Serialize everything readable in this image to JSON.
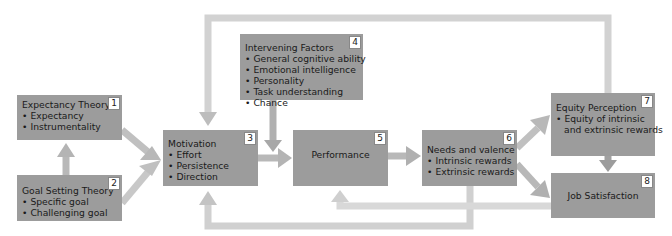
{
  "diagram": {
    "boxes": [
      {
        "id": 1,
        "number": "1",
        "title": "Expectancy Theory",
        "items": [
          "Expectancy",
          "Instrumentality"
        ]
      },
      {
        "id": 2,
        "number": "2",
        "title": "Goal Setting Theory",
        "items": [
          "Specific goal",
          "Challenging goal"
        ]
      },
      {
        "id": 3,
        "number": "3",
        "title": "Motivation",
        "items": [
          "Effort",
          "Persistence",
          "Direction"
        ]
      },
      {
        "id": 4,
        "number": "4",
        "title": "Intervening Factors",
        "items": [
          "General cognitive ability",
          "Emotional intelligence",
          "Personality",
          "Task understanding",
          "Chance"
        ]
      },
      {
        "id": 5,
        "number": "5",
        "title": "Performance",
        "items": []
      },
      {
        "id": 6,
        "number": "6",
        "title": "Needs and valence",
        "items": [
          "Intrinsic rewards",
          "Extrinsic rewards"
        ]
      },
      {
        "id": 7,
        "number": "7",
        "title": "Equity Perception",
        "items": [
          "Equity of intrinsic",
          "and extrinsic rewards"
        ]
      },
      {
        "id": 8,
        "number": "8",
        "title": "Job Satisfaction",
        "items": []
      }
    ],
    "connections": [
      {
        "from": 2,
        "to": 1
      },
      {
        "from": 1,
        "to": 3
      },
      {
        "from": 2,
        "to": 3
      },
      {
        "from": 4,
        "to": 5
      },
      {
        "from": 3,
        "to": 5
      },
      {
        "from": 5,
        "to": 6
      },
      {
        "from": 6,
        "to": 7
      },
      {
        "from": 6,
        "to": 8
      },
      {
        "from": 7,
        "to": 8
      },
      {
        "from": 7,
        "to": 3,
        "route": "top feedback loop"
      },
      {
        "from": 6,
        "to": 3,
        "route": "bottom feedback loop"
      },
      {
        "from": 8,
        "to": 5,
        "route": "bottom feedback loop"
      }
    ],
    "colors": {
      "box_fill": "#9c9c9c",
      "arrow_fill": "#c8c8c8",
      "arrow_dark": "#a8a8a8",
      "badge_bg": "#ffffff"
    }
  }
}
